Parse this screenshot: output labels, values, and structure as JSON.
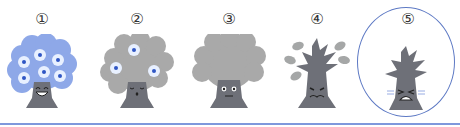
{
  "figure": {
    "stages": [
      {
        "label": "①",
        "state": "full-blossom",
        "face": "laughing",
        "flower_count": 6,
        "canopy": "blue"
      },
      {
        "label": "②",
        "state": "few-blossoms",
        "face": "sleepy",
        "flower_count": 3,
        "canopy": "gray"
      },
      {
        "label": "③",
        "state": "no-blossoms",
        "face": "worried",
        "flower_count": 0,
        "canopy": "gray"
      },
      {
        "label": "④",
        "state": "falling-leaves",
        "face": "frowning",
        "flower_count": 0,
        "canopy": "sparse-leaves"
      },
      {
        "label": "⑤",
        "state": "bare",
        "face": "crying",
        "flower_count": 0,
        "canopy": "none",
        "highlighted": true
      }
    ],
    "colors": {
      "canopy_blue": "#8ea8e8",
      "canopy_gray": "#a9a9a9",
      "trunk": "#6e7078",
      "flower_petal": "#e8f0ff",
      "flower_center": "#2f56c4",
      "leaf": "#a5a7a7",
      "highlight_ring": "#5d79c4",
      "rule": "#7f98dc"
    }
  }
}
